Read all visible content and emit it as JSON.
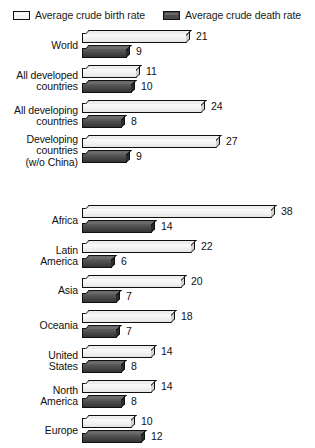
{
  "legend": {
    "items": [
      {
        "label": "Average crude birth rate",
        "swatch": "light-swatch-icon",
        "color": "#f2f2f2"
      },
      {
        "label": "Average crude death rate",
        "swatch": "dark-swatch-icon",
        "color": "#4a4a4a"
      }
    ]
  },
  "chart_data": {
    "type": "bar",
    "orientation": "horizontal",
    "title": "",
    "subtitle": "",
    "xlabel": "",
    "ylabel": "",
    "grid": false,
    "legend_position": "top",
    "axis_visible": false,
    "value_labels": true,
    "xlim": [
      0,
      38
    ],
    "categories": [
      "World",
      "All developed\ncountries",
      "All developing\ncountries",
      "Developing\ncountries\n(w/o China)",
      "Africa",
      "Latin\nAmerica",
      "Asia",
      "Oceania",
      "United\nStates",
      "North\nAmerica",
      "Europe"
    ],
    "series": [
      {
        "name": "Average crude birth rate",
        "color": "#f2f2f2",
        "values": [
          21,
          11,
          24,
          27,
          38,
          22,
          20,
          18,
          14,
          14,
          10
        ]
      },
      {
        "name": "Average crude death rate",
        "color": "#4a4a4a",
        "values": [
          9,
          10,
          8,
          9,
          14,
          6,
          7,
          7,
          8,
          8,
          12
        ]
      }
    ],
    "groups": [
      {
        "name": "development-groups",
        "rows": [
          {
            "category": "World",
            "birth": 21,
            "death": 9
          },
          {
            "category": "All developed\ncountries",
            "birth": 11,
            "death": 10
          },
          {
            "category": "All developing\ncountries",
            "birth": 24,
            "death": 8
          },
          {
            "category": "Developing\ncountries\n(w/o China)",
            "birth": 27,
            "death": 9
          }
        ]
      },
      {
        "name": "regions",
        "rows": [
          {
            "category": "Africa",
            "birth": 38,
            "death": 14
          },
          {
            "category": "Latin\nAmerica",
            "birth": 22,
            "death": 6
          },
          {
            "category": "Asia",
            "birth": 20,
            "death": 7
          },
          {
            "category": "Oceania",
            "birth": 18,
            "death": 7
          },
          {
            "category": "United\nStates",
            "birth": 14,
            "death": 8
          },
          {
            "category": "North\nAmerica",
            "birth": 14,
            "death": 8
          },
          {
            "category": "Europe",
            "birth": 10,
            "death": 12
          }
        ]
      }
    ]
  },
  "scale": {
    "px_per_unit": 5.0,
    "bars_origin_x": 82
  }
}
